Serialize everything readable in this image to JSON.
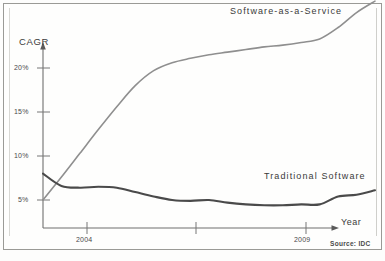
{
  "chart_data": {
    "type": "line",
    "title": "",
    "xlabel": "Year",
    "ylabel": "CAGR",
    "source": "Source: IDC",
    "grid": false,
    "legend_position": "inline-annotations",
    "ylim": [
      0,
      28
    ],
    "ytick_labels": [
      "5%",
      "10%",
      "15%",
      "20%"
    ],
    "ytick_values": [
      5,
      10,
      15,
      20
    ],
    "xtick_labels": [
      "2004",
      "2009"
    ],
    "x": [
      2002.0,
      2002.5,
      2003.0,
      2003.5,
      2004.0,
      2004.5,
      2005.0,
      2005.5,
      2006.0,
      2006.5,
      2007.0,
      2007.5,
      2008.0,
      2008.5,
      2009.0,
      2009.5,
      2010.0,
      2010.5,
      2011.0
    ],
    "series": [
      {
        "name": "Software-as-a-Service",
        "color": "#8f8f8f",
        "values": [
          5.0,
          7.6,
          10.3,
          13.0,
          15.6,
          18.0,
          19.7,
          20.6,
          21.1,
          21.5,
          21.8,
          22.1,
          22.4,
          22.6,
          22.9,
          23.3,
          24.6,
          26.3,
          27.6
        ]
      },
      {
        "name": "Traditional Software",
        "color": "#4a4a4a",
        "values": [
          8.0,
          6.6,
          6.4,
          6.5,
          6.4,
          5.9,
          5.4,
          5.0,
          4.9,
          5.0,
          4.7,
          4.5,
          4.4,
          4.4,
          4.5,
          4.5,
          5.4,
          5.6,
          6.1
        ]
      }
    ],
    "annotations": [
      {
        "text": "Software-as-a-Service",
        "series": "Software-as-a-Service"
      },
      {
        "text": "Traditional Software",
        "series": "Traditional Software"
      }
    ]
  },
  "axes": {
    "y_title": "CAGR",
    "x_title": "Year",
    "y_ticks": [
      {
        "label": "20%"
      },
      {
        "label": "15%"
      },
      {
        "label": "10%"
      },
      {
        "label": "5%"
      }
    ],
    "x_ticks": [
      {
        "label": "2004"
      },
      {
        "label": "2009"
      }
    ]
  },
  "labels": {
    "saas": "Software-as-a-Service",
    "traditional": "Traditional Software",
    "source": "Source: IDC"
  }
}
